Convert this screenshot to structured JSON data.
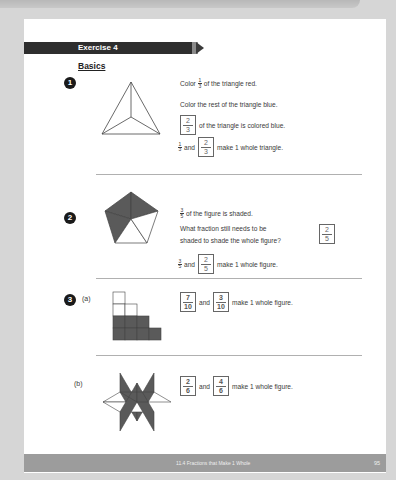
{
  "header": {
    "exercise_title": "Exercise 4",
    "section": "Basics"
  },
  "problems": [
    {
      "number": "1",
      "lines": [
        {
          "before": "Color",
          "fraction": {
            "n": "1",
            "d": "3"
          },
          "after": "of the triangle red."
        },
        {
          "text": "Color the rest of the triangle blue."
        },
        {
          "answer": {
            "n": "2",
            "d": "3"
          },
          "after": "of the triangle is colored blue."
        },
        {
          "fraction": {
            "n": "1",
            "d": "3"
          },
          "mid": "and",
          "answer": {
            "n": "2",
            "d": "3"
          },
          "after": "make 1 whole triangle."
        }
      ],
      "figure": "triangle divided into 3 equal parts"
    },
    {
      "number": "2",
      "lines": [
        {
          "fraction": {
            "n": "3",
            "d": "5"
          },
          "after": "of the figure is shaded."
        },
        {
          "text1": "What fraction still needs to be",
          "text2": "shaded to shade the whole figure?",
          "answer": {
            "n": "2",
            "d": "5"
          }
        },
        {
          "fraction": {
            "n": "3",
            "d": "5"
          },
          "mid": "and",
          "answer": {
            "n": "2",
            "d": "5"
          },
          "after": "make 1 whole figure."
        }
      ],
      "figure": "pentagon with 3 of 5 parts shaded"
    },
    {
      "number": "3",
      "parts": [
        {
          "label": "(a)",
          "answer1": {
            "n": "7",
            "d": "10"
          },
          "mid": "and",
          "answer2": {
            "n": "3",
            "d": "10"
          },
          "after": "make 1 whole figure.",
          "figure": "staircase of 10 squares, 7 shaded"
        },
        {
          "label": "(b)",
          "answer1": {
            "n": "2",
            "d": "6"
          },
          "mid": "and",
          "answer2": {
            "n": "4",
            "d": "6"
          },
          "after": "make 1 whole figure.",
          "figure": "6-point star of rhombi, 4 shaded"
        }
      ]
    }
  ],
  "footer": {
    "title": "11.4  Fractions that Make 1 Whole",
    "page": "95"
  },
  "colors": {
    "shade": "#5a5a5a",
    "bar": "#2e2e2e",
    "footer": "#9c9c9c",
    "background": "#d6d6d6"
  }
}
